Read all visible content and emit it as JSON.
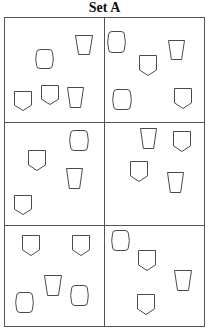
{
  "title": "Set A",
  "grid": {
    "rows": 3,
    "cols": 2,
    "border_color": "#555555",
    "shape_stroke_color": "#4a4a4a"
  },
  "shape_types": {
    "shield": "pentagon-shield-icon (rectangle with pointed bottom)",
    "barrel": "barrel-icon (rounded rectangle with bulging sides)",
    "cup": "cup-icon (inverted trapezoid)"
  },
  "cells": [
    {
      "id": "cell-1",
      "row": 1,
      "col": 1,
      "shapes": [
        {
          "type": "barrel",
          "x": 36,
          "y": 49,
          "w": 16,
          "h": 19
        },
        {
          "type": "cup",
          "x": 75,
          "y": 35,
          "w": 17,
          "h": 19
        },
        {
          "type": "shield",
          "x": 14,
          "y": 91,
          "w": 17,
          "h": 19
        },
        {
          "type": "shield",
          "x": 41,
          "y": 85,
          "w": 17,
          "h": 19
        },
        {
          "type": "cup",
          "x": 67,
          "y": 87,
          "w": 16,
          "h": 20
        }
      ]
    },
    {
      "id": "cell-2",
      "row": 1,
      "col": 2,
      "shapes": [
        {
          "type": "barrel",
          "x": 108,
          "y": 31,
          "w": 16,
          "h": 21
        },
        {
          "type": "cup",
          "x": 168,
          "y": 40,
          "w": 16,
          "h": 19
        },
        {
          "type": "shield",
          "x": 139,
          "y": 55,
          "w": 17,
          "h": 20
        },
        {
          "type": "barrel",
          "x": 113,
          "y": 89,
          "w": 17,
          "h": 20
        },
        {
          "type": "shield",
          "x": 174,
          "y": 88,
          "w": 17,
          "h": 20
        }
      ]
    },
    {
      "id": "cell-3",
      "row": 2,
      "col": 1,
      "shapes": [
        {
          "type": "barrel",
          "x": 70,
          "y": 130,
          "w": 17,
          "h": 20
        },
        {
          "type": "shield",
          "x": 28,
          "y": 150,
          "w": 17,
          "h": 20
        },
        {
          "type": "cup",
          "x": 66,
          "y": 168,
          "w": 16,
          "h": 20
        },
        {
          "type": "shield",
          "x": 14,
          "y": 195,
          "w": 17,
          "h": 19
        }
      ]
    },
    {
      "id": "cell-4",
      "row": 2,
      "col": 2,
      "shapes": [
        {
          "type": "cup",
          "x": 140,
          "y": 128,
          "w": 16,
          "h": 20
        },
        {
          "type": "shield",
          "x": 173,
          "y": 131,
          "w": 17,
          "h": 20
        },
        {
          "type": "shield",
          "x": 130,
          "y": 161,
          "w": 17,
          "h": 20
        },
        {
          "type": "cup",
          "x": 167,
          "y": 172,
          "w": 16,
          "h": 20
        }
      ]
    },
    {
      "id": "cell-5",
      "row": 3,
      "col": 1,
      "shapes": [
        {
          "type": "shield",
          "x": 22,
          "y": 235,
          "w": 17,
          "h": 20
        },
        {
          "type": "shield",
          "x": 72,
          "y": 235,
          "w": 17,
          "h": 20
        },
        {
          "type": "cup",
          "x": 44,
          "y": 275,
          "w": 17,
          "h": 20
        },
        {
          "type": "barrel",
          "x": 16,
          "y": 292,
          "w": 16,
          "h": 20
        },
        {
          "type": "barrel",
          "x": 71,
          "y": 285,
          "w": 16,
          "h": 20
        }
      ]
    },
    {
      "id": "cell-6",
      "row": 3,
      "col": 2,
      "shapes": [
        {
          "type": "barrel",
          "x": 112,
          "y": 230,
          "w": 16,
          "h": 20
        },
        {
          "type": "shield",
          "x": 138,
          "y": 250,
          "w": 17,
          "h": 20
        },
        {
          "type": "cup",
          "x": 174,
          "y": 270,
          "w": 17,
          "h": 20
        },
        {
          "type": "shield",
          "x": 137,
          "y": 294,
          "w": 17,
          "h": 20
        }
      ]
    }
  ],
  "shape_counts": {
    "cell-1": {
      "shield": 2,
      "barrel": 1,
      "cup": 2
    },
    "cell-2": {
      "shield": 2,
      "barrel": 2,
      "cup": 1
    },
    "cell-3": {
      "shield": 2,
      "barrel": 1,
      "cup": 1
    },
    "cell-4": {
      "shield": 2,
      "barrel": 0,
      "cup": 2
    },
    "cell-5": {
      "shield": 2,
      "barrel": 2,
      "cup": 1
    },
    "cell-6": {
      "shield": 2,
      "barrel": 1,
      "cup": 1
    }
  }
}
